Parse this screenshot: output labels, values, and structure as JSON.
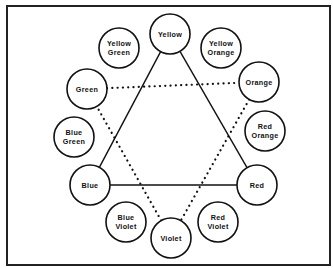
{
  "diagram": {
    "title": "",
    "frame": {
      "x": 7,
      "y": 6,
      "w": 323,
      "h": 259
    },
    "circle_radius": 20,
    "nodes": [
      {
        "id": "yellow",
        "lines": [
          "Yellow"
        ],
        "x": 170,
        "y": 34
      },
      {
        "id": "yellow-green",
        "lines": [
          "Yellow",
          "Green"
        ],
        "x": 119,
        "y": 48
      },
      {
        "id": "yellow-orange",
        "lines": [
          "Yellow",
          "Orange"
        ],
        "x": 221,
        "y": 48
      },
      {
        "id": "green",
        "lines": [
          "Green"
        ],
        "x": 87,
        "y": 89
      },
      {
        "id": "orange",
        "lines": [
          "Orange"
        ],
        "x": 259,
        "y": 82
      },
      {
        "id": "blue-green",
        "lines": [
          "Blue",
          "Green"
        ],
        "x": 74,
        "y": 137
      },
      {
        "id": "red-orange",
        "lines": [
          "Red",
          "Orange"
        ],
        "x": 265,
        "y": 131
      },
      {
        "id": "blue",
        "lines": [
          "Blue"
        ],
        "x": 90,
        "y": 185
      },
      {
        "id": "red",
        "lines": [
          "Red"
        ],
        "x": 257,
        "y": 185
      },
      {
        "id": "blue-violet",
        "lines": [
          "Blue",
          "Violet"
        ],
        "x": 126,
        "y": 222
      },
      {
        "id": "violet",
        "lines": [
          "Violet"
        ],
        "x": 171,
        "y": 238
      },
      {
        "id": "red-violet",
        "lines": [
          "Red",
          "Violet"
        ],
        "x": 218,
        "y": 222
      }
    ],
    "solid_triangle": [
      "yellow",
      "red",
      "blue"
    ],
    "dotted_triangle": [
      "green",
      "orange",
      "violet"
    ],
    "solid_triangle_label": "Primary colors",
    "dotted_triangle_label": "Secondary colors"
  }
}
